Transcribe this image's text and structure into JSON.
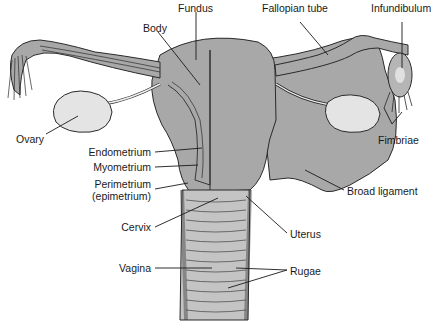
{
  "diagram": {
    "type": "anatomical illustration",
    "colors": {
      "background": "#ffffff",
      "tissue": "#a8a8a8",
      "tissue_light": "#c4c4c4",
      "ovary": "#e4e4e4",
      "outline": "#2a2a2a",
      "label_text": "#1a1a1a"
    },
    "labels": {
      "fundus": "Fundus",
      "body": "Body",
      "fallopian_tube": "Fallopian tube",
      "infundibulum": "Infundibulum",
      "ovary": "Ovary",
      "fimbriae": "Fimbriae",
      "endometrium": "Endometrium",
      "myometrium": "Myometrium",
      "perimetrium_1": "Perimetrium",
      "perimetrium_2": "(epimetrium)",
      "broad_ligament": "Broad ligament",
      "cervix": "Cervix",
      "uterus": "Uterus",
      "vagina": "Vagina",
      "rugae": "Rugae"
    }
  }
}
